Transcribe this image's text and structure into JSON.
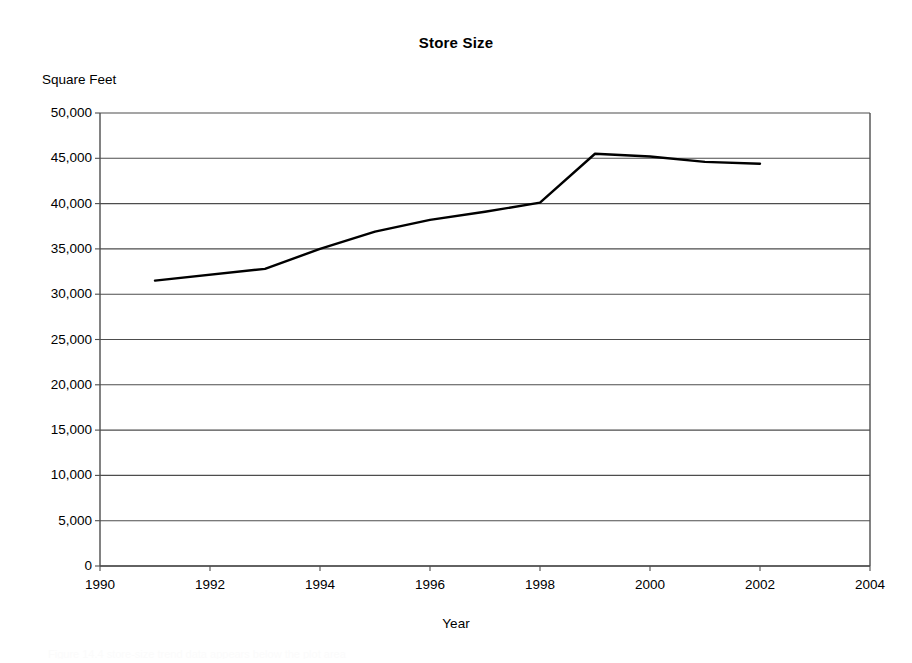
{
  "chart_data": {
    "type": "line",
    "title": "Store Size",
    "xlabel": "Year",
    "ylabel": "Square Feet",
    "x": [
      1991,
      1993,
      1994,
      1995,
      1996,
      1997,
      1998,
      1999,
      2000,
      2001,
      2002
    ],
    "values": [
      31500,
      32800,
      35000,
      36900,
      38200,
      39100,
      40100,
      45500,
      45200,
      44600,
      44400
    ],
    "series": [
      {
        "name": "Store Size",
        "values": [
          31500,
          32800,
          35000,
          36900,
          38200,
          39100,
          40100,
          45500,
          45200,
          44600,
          44400
        ]
      }
    ],
    "xlim": [
      1990,
      2004
    ],
    "ylim": [
      0,
      50000
    ],
    "x_ticks": [
      1990,
      1992,
      1994,
      1996,
      1998,
      2000,
      2002,
      2004
    ],
    "x_tick_labels": [
      "1990",
      "1992",
      "1994",
      "1996",
      "1998",
      "2000",
      "2002",
      "2004"
    ],
    "y_ticks": [
      0,
      5000,
      10000,
      15000,
      20000,
      25000,
      30000,
      35000,
      40000,
      45000,
      50000
    ],
    "y_tick_labels": [
      "0",
      "5,000",
      "10,000",
      "15,000",
      "20,000",
      "25,000",
      "30,000",
      "35,000",
      "40,000",
      "45,000",
      "50,000"
    ],
    "grid": "horizontal",
    "legend": "none",
    "line_color": "#000000",
    "line_width": 2.4,
    "grid_color": "#4d4d4d",
    "axis_color": "#4d4d4d",
    "background": "#ffffff"
  },
  "annotations": {
    "bottom_faint_text": "Figure 14.4 store-size trend data appears below the plot area"
  }
}
